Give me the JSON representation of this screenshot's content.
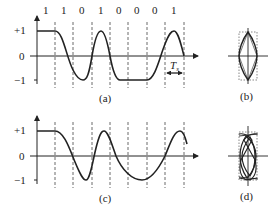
{
  "panels": {
    "a": {
      "caption": "(a)",
      "bits": [
        "1",
        "1",
        "0",
        "1",
        "0",
        "0",
        "0",
        "1"
      ],
      "y_ticks": {
        "pos": "+1",
        "zero": "0",
        "neg": "−1"
      },
      "period_label": "T",
      "period_subscript": "s"
    },
    "b": {
      "caption": "(b)"
    },
    "c": {
      "caption": "(c)",
      "y_ticks": {
        "pos": "+1",
        "zero": "0",
        "neg": "−1"
      }
    },
    "d": {
      "caption": "(d)"
    }
  },
  "colors": {
    "stroke": "#222222",
    "dashed": "#444444"
  }
}
